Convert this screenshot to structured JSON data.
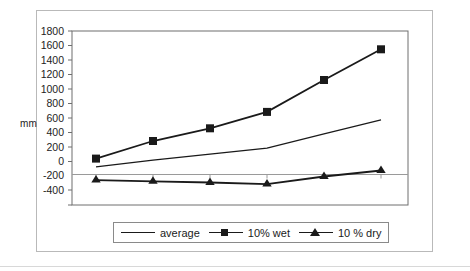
{
  "chart_data": {
    "type": "line",
    "title": "",
    "xlabel": "",
    "ylabel": "mm",
    "categories": [
      "May",
      "Jun",
      "Jul",
      "Aug",
      "Sep",
      "Oct"
    ],
    "yticks": [
      1800,
      1600,
      1400,
      1200,
      1000,
      800,
      600,
      400,
      200,
      0,
      -200,
      -400
    ],
    "ylim": [
      -400,
      1800
    ],
    "grid": false,
    "legend_position": "bottom",
    "series": [
      {
        "name": "average",
        "marker": "none",
        "values": [
          95,
          180,
          255,
          330,
          510,
          685
        ]
      },
      {
        "name": "10% wet",
        "marker": "square",
        "values": [
          200,
          420,
          580,
          785,
          1185,
          1570
        ]
      },
      {
        "name": "10 % dry",
        "marker": "triangle",
        "values": [
          -70,
          -85,
          -100,
          -120,
          -25,
          50
        ]
      }
    ]
  },
  "axis": {
    "y_title": "mm",
    "y_tick_labels": [
      "1800",
      "1600",
      "1400",
      "1200",
      "1000",
      "800",
      "600",
      "400",
      "200",
      "0",
      "-200",
      "-400"
    ],
    "x_tick_labels": [
      "May",
      "Jun",
      "Jul",
      "Aug",
      "Sep",
      "Oct"
    ]
  },
  "legend": {
    "items": [
      {
        "label": "average",
        "key": "line-key"
      },
      {
        "label": "10% wet",
        "key": "square-marker-key"
      },
      {
        "label": "10 % dry",
        "key": "triangle-marker-key"
      }
    ]
  },
  "colors": {
    "series_line": "#1a1a1a",
    "axis": "#5a5a5a",
    "frame": "#b9b9b9",
    "background": "#ffffff"
  }
}
